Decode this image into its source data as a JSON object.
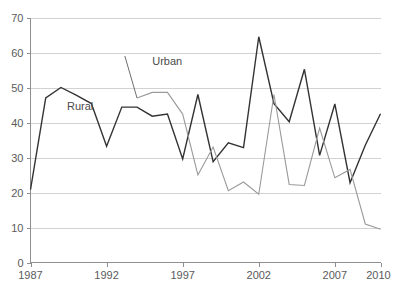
{
  "chart_data": {
    "type": "line",
    "title": "",
    "xlabel": "",
    "ylabel": "",
    "xlim": [
      1987,
      2010
    ],
    "ylim": [
      0,
      70
    ],
    "grid": true,
    "legend_position": "inline-annotations",
    "x": [
      1987,
      1988,
      1989,
      1990,
      1991,
      1992,
      1993,
      1994,
      1995,
      1996,
      1997,
      1998,
      1999,
      2000,
      2001,
      2002,
      2003,
      2004,
      2005,
      2006,
      2007,
      2008,
      2009,
      2010
    ],
    "x_tick_labels": [
      "1987",
      "1992",
      "1997",
      "2002",
      "2007",
      "2010"
    ],
    "x_tick_values": [
      1987,
      1992,
      1997,
      2002,
      2007,
      2010
    ],
    "y_tick_labels": [
      "0",
      "10",
      "20",
      "30",
      "40",
      "50",
      "60",
      "70"
    ],
    "y_tick_values": [
      0,
      10,
      20,
      30,
      40,
      50,
      60,
      70
    ],
    "series": [
      {
        "name": "Rural",
        "color": "#333333",
        "label_x": 1989.4,
        "label_y": 43.5,
        "x": [
          1987,
          1988,
          1989,
          1990,
          1991,
          1992,
          1993,
          1994,
          1995,
          1996,
          1997,
          1998,
          1999,
          2000,
          2001,
          2002,
          2003,
          2004,
          2005,
          2006,
          2007,
          2008,
          2009,
          2010
        ],
        "values": [
          20.8,
          47.0,
          50.0,
          47.8,
          45.4,
          33.2,
          44.4,
          44.4,
          41.8,
          42.4,
          29.6,
          48.0,
          28.8,
          34.2,
          32.8,
          64.5,
          45.4,
          40.2,
          55.2,
          30.6,
          45.3,
          22.8,
          33.5,
          42.5
        ]
      },
      {
        "name": "Urban",
        "color": "#9a9a9a",
        "label_x": 1995.0,
        "label_y": 56.5,
        "leader_from_x": 1993.2,
        "leader_from_y": 59.0,
        "leader_to_x": 1994.0,
        "leader_to_y": 47.0,
        "x": [
          1994,
          1995,
          1996,
          1997,
          1998,
          1999,
          2000,
          2001,
          2002,
          2003,
          2004,
          2005,
          2006,
          2007,
          2008,
          2009,
          2010
        ],
        "values": [
          47.0,
          48.6,
          48.6,
          42.4,
          25.0,
          33.0,
          20.5,
          23.0,
          19.5,
          48.0,
          22.3,
          22.0,
          38.4,
          24.2,
          26.6,
          11.0,
          9.5
        ]
      }
    ]
  }
}
